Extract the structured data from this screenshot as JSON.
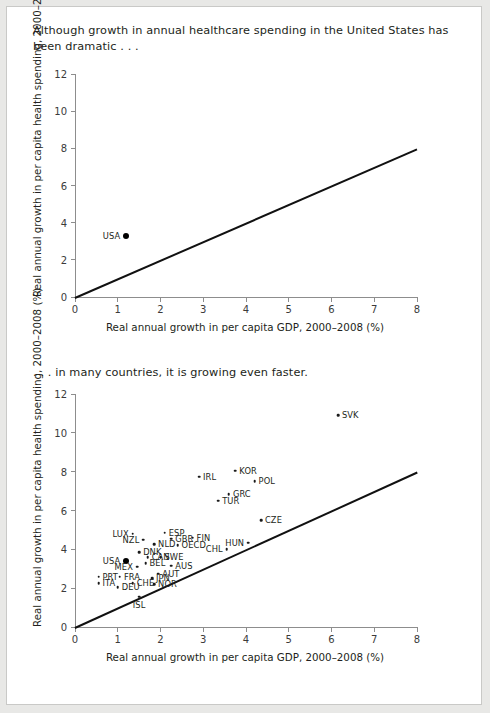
{
  "page": {
    "caption_top": "Although growth in annual healthcare spending in the United States has been dramatic . . .",
    "caption_middle": ". . . in many countries, it is growing even faster."
  },
  "chart_data": [
    {
      "id": "chart-top",
      "type": "scatter",
      "title": "Although growth in annual healthcare spending in the United States has been dramatic . . .",
      "xlabel": "Real annual growth in per capita GDP, 2000–2008 (%)",
      "ylabel": "Real annual growth in per capita health spending, 2000–2008 (%)",
      "xlim": [
        0,
        8
      ],
      "ylim": [
        0,
        12
      ],
      "xticks": [
        0,
        1,
        2,
        3,
        4,
        5,
        6,
        7,
        8
      ],
      "yticks": [
        0,
        2,
        4,
        6,
        8,
        10,
        12
      ],
      "grid": false,
      "legend": "none",
      "reference_line": {
        "label": "45-degree parity line",
        "from": [
          0,
          0
        ],
        "to": [
          8,
          8
        ]
      },
      "points": [
        {
          "label": "USA",
          "x": 1.2,
          "y": 3.3,
          "label_pos": "left",
          "emphasis": true
        }
      ]
    },
    {
      "id": "chart-bottom",
      "type": "scatter",
      "title": ". . . in many countries, it is growing even faster.",
      "xlabel": "Real annual growth in per capita GDP, 2000–2008 (%)",
      "ylabel": "Real annual growth in per capita health spending, 2000–2008 (%)",
      "xlim": [
        0,
        8
      ],
      "ylim": [
        0,
        12
      ],
      "xticks": [
        0,
        1,
        2,
        3,
        4,
        5,
        6,
        7,
        8
      ],
      "yticks": [
        0,
        2,
        4,
        6,
        8,
        10,
        12
      ],
      "grid": false,
      "legend": "none",
      "reference_line": {
        "label": "45-degree parity line",
        "from": [
          0,
          0
        ],
        "to": [
          8,
          8
        ]
      },
      "points": [
        {
          "label": "SVK",
          "x": 6.15,
          "y": 10.9,
          "label_pos": "right"
        },
        {
          "label": "KOR",
          "x": 3.75,
          "y": 8.05,
          "label_pos": "right"
        },
        {
          "label": "IRL",
          "x": 2.9,
          "y": 7.75,
          "label_pos": "right"
        },
        {
          "label": "POL",
          "x": 4.2,
          "y": 7.5,
          "label_pos": "right"
        },
        {
          "label": "GRC",
          "x": 3.6,
          "y": 6.85,
          "label_pos": "right"
        },
        {
          "label": "TUR",
          "x": 3.35,
          "y": 6.5,
          "label_pos": "right"
        },
        {
          "label": "CZE",
          "x": 4.35,
          "y": 5.5,
          "label_pos": "right"
        },
        {
          "label": "ESP",
          "x": 2.1,
          "y": 4.85,
          "label_pos": "right"
        },
        {
          "label": "LUX",
          "x": 1.35,
          "y": 4.8,
          "label_pos": "left"
        },
        {
          "label": "FIN",
          "x": 2.75,
          "y": 4.6,
          "label_pos": "right"
        },
        {
          "label": "GBR",
          "x": 2.25,
          "y": 4.55,
          "label_pos": "right"
        },
        {
          "label": "NZL",
          "x": 1.6,
          "y": 4.5,
          "label_pos": "left"
        },
        {
          "label": "NLD",
          "x": 1.85,
          "y": 4.25,
          "label_pos": "right"
        },
        {
          "label": "OECD",
          "x": 2.4,
          "y": 4.2,
          "label_pos": "right"
        },
        {
          "label": "HUN",
          "x": 4.05,
          "y": 4.35,
          "label_pos": "left"
        },
        {
          "label": "CHL",
          "x": 3.55,
          "y": 4.0,
          "label_pos": "left"
        },
        {
          "label": "DNK",
          "x": 1.5,
          "y": 3.85,
          "label_pos": "right"
        },
        {
          "label": "CAN",
          "x": 1.7,
          "y": 3.6,
          "label_pos": "right"
        },
        {
          "label": "SWE",
          "x": 2.0,
          "y": 3.6,
          "label_pos": "right"
        },
        {
          "label": "USA",
          "x": 1.2,
          "y": 3.4,
          "label_pos": "left",
          "emphasis": true
        },
        {
          "label": "BEL",
          "x": 1.65,
          "y": 3.3,
          "label_pos": "right"
        },
        {
          "label": "MEX",
          "x": 1.45,
          "y": 3.1,
          "label_pos": "left"
        },
        {
          "label": "AUS",
          "x": 2.25,
          "y": 3.15,
          "label_pos": "right"
        },
        {
          "label": "AUT",
          "x": 1.95,
          "y": 2.75,
          "label_pos": "right"
        },
        {
          "label": "PRT",
          "x": 0.55,
          "y": 2.6,
          "label_pos": "right"
        },
        {
          "label": "FRA",
          "x": 1.05,
          "y": 2.6,
          "label_pos": "right"
        },
        {
          "label": "JPN",
          "x": 1.8,
          "y": 2.5,
          "label_pos": "right"
        },
        {
          "label": "ITA",
          "x": 0.55,
          "y": 2.25,
          "label_pos": "right"
        },
        {
          "label": "CHE",
          "x": 1.35,
          "y": 2.25,
          "label_pos": "right"
        },
        {
          "label": "NOR",
          "x": 1.85,
          "y": 2.2,
          "label_pos": "right"
        },
        {
          "label": "DEU",
          "x": 1.0,
          "y": 2.05,
          "label_pos": "right"
        },
        {
          "label": "ISL",
          "x": 1.5,
          "y": 1.55,
          "label_pos": "below"
        }
      ]
    }
  ]
}
